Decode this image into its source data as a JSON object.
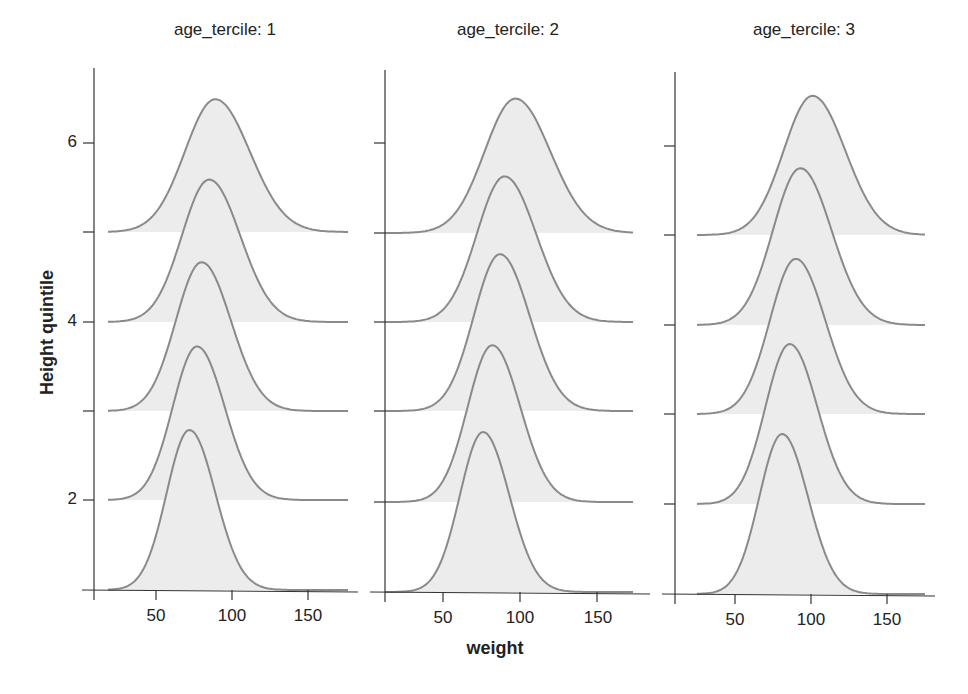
{
  "chart_data": {
    "type": "ridgeline-density",
    "title": "",
    "xlabel": "weight",
    "ylabel": "Height quintile",
    "facet_variable": "age_tercile",
    "panels": [
      {
        "title": "age_tercile: 1",
        "xlim": [
          10,
          180
        ],
        "xticks": [
          50,
          100,
          150
        ],
        "yticks_labeled": [
          2,
          4,
          6
        ],
        "series": [
          {
            "quintile": 1,
            "mean": 72,
            "sd": 15,
            "rel_height": 1.0
          },
          {
            "quintile": 2,
            "mean": 77,
            "sd": 16,
            "rel_height": 0.96
          },
          {
            "quintile": 3,
            "mean": 80,
            "sd": 17,
            "rel_height": 0.93
          },
          {
            "quintile": 4,
            "mean": 85,
            "sd": 18,
            "rel_height": 0.89
          },
          {
            "quintile": 5,
            "mean": 89,
            "sd": 20,
            "rel_height": 0.83
          }
        ]
      },
      {
        "title": "age_tercile: 2",
        "xlim": [
          10,
          180
        ],
        "xticks": [
          50,
          100,
          150
        ],
        "yticks_labeled": [],
        "series": [
          {
            "quintile": 1,
            "mean": 76,
            "sd": 15,
            "rel_height": 1.0
          },
          {
            "quintile": 2,
            "mean": 82,
            "sd": 16,
            "rel_height": 0.98
          },
          {
            "quintile": 3,
            "mean": 87,
            "sd": 17,
            "rel_height": 0.98
          },
          {
            "quintile": 4,
            "mean": 90,
            "sd": 18,
            "rel_height": 0.91
          },
          {
            "quintile": 5,
            "mean": 97,
            "sd": 20,
            "rel_height": 0.84
          }
        ]
      },
      {
        "title": "age_tercile: 3",
        "xlim": [
          10,
          180
        ],
        "xticks": [
          50,
          100,
          150
        ],
        "yticks_labeled": [],
        "series": [
          {
            "quintile": 1,
            "mean": 81,
            "sd": 15,
            "rel_height": 1.0
          },
          {
            "quintile": 2,
            "mean": 86,
            "sd": 16,
            "rel_height": 1.0
          },
          {
            "quintile": 3,
            "mean": 90,
            "sd": 17,
            "rel_height": 0.97
          },
          {
            "quintile": 4,
            "mean": 93,
            "sd": 18,
            "rel_height": 0.98
          },
          {
            "quintile": 5,
            "mean": 101,
            "sd": 19,
            "rel_height": 0.87
          }
        ]
      }
    ],
    "y_axis": {
      "range": [
        1,
        7
      ],
      "ticks": [
        1,
        2,
        3,
        4,
        5,
        6
      ],
      "labels": [
        "",
        "2",
        "",
        "4",
        "",
        "6"
      ]
    },
    "colors": {
      "fill": "#ececec",
      "line": "#8a8a8a",
      "axis": "#333333"
    }
  },
  "labels": {
    "panel_titles": [
      "age_tercile: 1",
      "age_tercile: 2",
      "age_tercile: 3"
    ],
    "xlabel": "weight",
    "ylabel": "Height quintile",
    "ytick_labels": {
      "y2": "2",
      "y4": "4",
      "y6": "6"
    },
    "xtick_labels": [
      "50",
      "100",
      "150"
    ]
  }
}
